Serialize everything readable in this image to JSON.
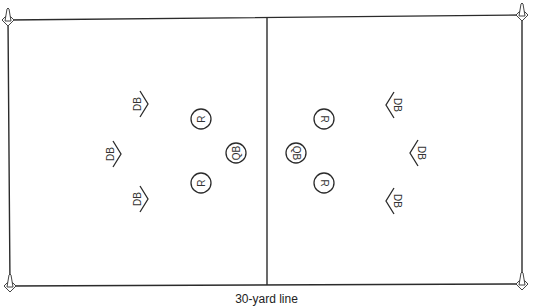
{
  "diagram": {
    "caption": "30-yard line",
    "field": {
      "corners": {
        "tl": [
          8,
          20
        ],
        "tr": [
          522,
          15
        ],
        "br": [
          522,
          284
        ],
        "bl": [
          10,
          286
        ]
      },
      "midline": {
        "top": [
          267,
          17
        ],
        "bottom": [
          267,
          285
        ]
      },
      "line_color": "#2b2b2b"
    },
    "cones": [
      {
        "name": "cone-top-left",
        "x": 8,
        "y": 20
      },
      {
        "name": "cone-top-right",
        "x": 522,
        "y": 15
      },
      {
        "name": "cone-bottom-left",
        "x": 10,
        "y": 286
      },
      {
        "name": "cone-bottom-right",
        "x": 522,
        "y": 284
      }
    ],
    "left_team": {
      "defenders": [
        {
          "label": "DB",
          "x": 146,
          "y": 104
        },
        {
          "label": "DB",
          "x": 119,
          "y": 154
        },
        {
          "label": "DB",
          "x": 146,
          "y": 199
        }
      ],
      "players": [
        {
          "label": "R",
          "x": 201,
          "y": 119
        },
        {
          "label": "QB",
          "x": 236,
          "y": 153
        },
        {
          "label": "R",
          "x": 201,
          "y": 183
        }
      ]
    },
    "right_team": {
      "defenders": [
        {
          "label": "DB",
          "x": 388,
          "y": 105
        },
        {
          "label": "DB",
          "x": 412,
          "y": 153
        },
        {
          "label": "DB",
          "x": 388,
          "y": 201
        }
      ],
      "players": [
        {
          "label": "R",
          "x": 324,
          "y": 119
        },
        {
          "label": "QB",
          "x": 296,
          "y": 153
        },
        {
          "label": "R",
          "x": 324,
          "y": 183
        }
      ]
    }
  }
}
